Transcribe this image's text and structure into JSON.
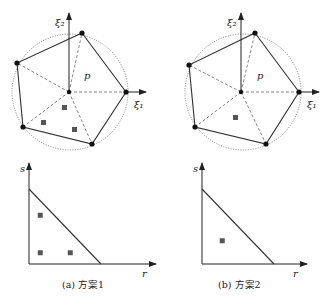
{
  "panels": [
    {
      "id": "a",
      "caption": "(a)  方案1",
      "top": {
        "xi1_label": "ξ₁",
        "xi2_label": "ξ₂",
        "region_label": "p",
        "quad_points_count": 3
      },
      "bottom": {
        "s_label": "s",
        "r_label": "r",
        "quad_points": [
          [
            0.15,
            0.65
          ],
          [
            0.15,
            0.15
          ],
          [
            0.55,
            0.15
          ]
        ]
      }
    },
    {
      "id": "b",
      "caption": "(b)  方案2",
      "top": {
        "xi1_label": "ξ₁",
        "xi2_label": "ξ₂",
        "region_label": "p",
        "quad_points_count": 1
      },
      "bottom": {
        "s_label": "s",
        "r_label": "r",
        "quad_points": [
          [
            0.27,
            0.31
          ]
        ]
      }
    }
  ],
  "colors": {
    "line": "#333333",
    "vertex": "#111111",
    "quad_point": "#555555"
  }
}
